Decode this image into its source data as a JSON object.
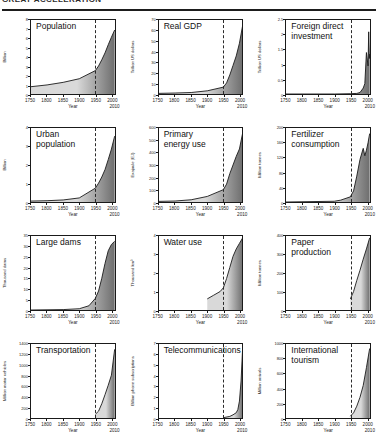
{
  "header": {
    "title": "GREAT ACCELERATION",
    "rule_color": "#1d1d1d"
  },
  "style": {
    "fill_light": "#d9d9d9",
    "fill_dark": "#6e6e6e",
    "line_color": "#1a1a1a",
    "marker_year": 1950
  },
  "axis": {
    "x_title": "Year",
    "x_ticks": [
      "1750",
      "1800",
      "1850",
      "1900",
      "1950",
      "2000"
    ],
    "x_end_label": "2010",
    "x_min": 1750,
    "x_max": 2010
  },
  "chart_data": [
    {
      "type": "area",
      "title": "Population",
      "ylabel": "Billion",
      "xlabel": "Year",
      "ylim": [
        0,
        8
      ],
      "yticks": [
        0,
        1,
        2,
        3,
        4,
        5,
        6,
        7,
        8
      ],
      "xlim": [
        1750,
        2010
      ],
      "grid": false,
      "legend": "none",
      "annotation": "dashed vertical line at 1950",
      "x": [
        1750,
        1800,
        1850,
        1900,
        1950,
        1960,
        1970,
        1980,
        1990,
        2000,
        2010
      ],
      "values": [
        0.79,
        0.98,
        1.26,
        1.65,
        2.53,
        3.03,
        3.7,
        4.44,
        5.32,
        6.14,
        6.92
      ]
    },
    {
      "type": "area",
      "title": "Real GDP",
      "ylabel": "Trillion US dollars",
      "xlabel": "Year",
      "ylim": [
        0,
        70
      ],
      "yticks": [
        0,
        10,
        20,
        30,
        40,
        50,
        60,
        70
      ],
      "xlim": [
        1750,
        2010
      ],
      "grid": false,
      "legend": "none",
      "annotation": "dashed vertical line at 1950",
      "x": [
        1750,
        1800,
        1850,
        1900,
        1950,
        1960,
        1970,
        1980,
        1990,
        2000,
        2010
      ],
      "values": [
        0.6,
        0.9,
        1.4,
        3.0,
        6.5,
        10.5,
        18.0,
        27.0,
        36.0,
        48.0,
        65.0
      ]
    },
    {
      "type": "area",
      "title": "Foreign direct\ninvestment",
      "ylabel": "Trillion US dollars",
      "xlabel": "Year",
      "ylim": [
        0,
        2.5
      ],
      "yticks": [
        0,
        0.5,
        1,
        1.5,
        2,
        2.5
      ],
      "xlim": [
        1750,
        2010
      ],
      "grid": false,
      "legend": "none",
      "annotation": "dashed vertical line at 1950",
      "x": [
        1750,
        1900,
        1950,
        1970,
        1980,
        1990,
        1995,
        2000,
        2005,
        2007,
        2009,
        2010
      ],
      "values": [
        0,
        0,
        0.01,
        0.02,
        0.05,
        0.2,
        0.35,
        1.4,
        0.95,
        2.1,
        1.2,
        1.35
      ]
    },
    {
      "type": "area",
      "title": "Urban\npopulation",
      "ylabel": "Billion",
      "xlabel": "Year",
      "ylim": [
        0,
        4
      ],
      "yticks": [
        0,
        1,
        2,
        3,
        4
      ],
      "xlim": [
        1750,
        2010
      ],
      "grid": false,
      "legend": "none",
      "annotation": "dashed vertical line at 1950",
      "x": [
        1750,
        1800,
        1850,
        1900,
        1950,
        1960,
        1970,
        1980,
        1990,
        2000,
        2010
      ],
      "values": [
        0.05,
        0.07,
        0.11,
        0.22,
        0.75,
        1.02,
        1.35,
        1.75,
        2.29,
        2.86,
        3.56
      ]
    },
    {
      "type": "area",
      "title": "Primary\nenergy use",
      "ylabel": "Exajoule (EJ)",
      "xlabel": "Year",
      "ylim": [
        0,
        600
      ],
      "yticks": [
        0,
        100,
        200,
        300,
        400,
        500,
        600
      ],
      "xlim": [
        1750,
        2010
      ],
      "grid": false,
      "legend": "none",
      "annotation": "dashed vertical line at 1950",
      "x": [
        1750,
        1800,
        1850,
        1900,
        1950,
        1960,
        1970,
        1980,
        1990,
        2000,
        2010
      ],
      "values": [
        5,
        8,
        18,
        45,
        100,
        145,
        230,
        300,
        370,
        430,
        560
      ]
    },
    {
      "type": "area",
      "title": "Fertilizer\nconsumption",
      "ylabel": "Million tonnes",
      "xlabel": "Year",
      "ylim": [
        0,
        200
      ],
      "yticks": [
        0,
        40,
        80,
        120,
        160,
        200
      ],
      "xlim": [
        1750,
        2010
      ],
      "grid": false,
      "legend": "none",
      "annotation": "dashed vertical line at 1950",
      "x": [
        1750,
        1900,
        1920,
        1950,
        1960,
        1970,
        1980,
        1990,
        1995,
        2000,
        2005,
        2010
      ],
      "values": [
        0,
        2,
        5,
        14,
        30,
        70,
        115,
        145,
        125,
        140,
        160,
        185
      ]
    },
    {
      "type": "area",
      "title": "Large dams",
      "ylabel": "Thousand dams",
      "xlabel": "Year",
      "ylim": [
        0,
        35
      ],
      "yticks": [
        0,
        5,
        10,
        15,
        20,
        25,
        30,
        35
      ],
      "xlim": [
        1750,
        2010
      ],
      "grid": false,
      "legend": "none",
      "annotation": "dashed vertical line at 1950",
      "x": [
        1750,
        1850,
        1900,
        1930,
        1950,
        1960,
        1970,
        1980,
        1990,
        2000,
        2010
      ],
      "values": [
        0,
        0.2,
        0.6,
        2.0,
        5.5,
        9.0,
        15.0,
        22.0,
        28.0,
        31.0,
        32.5
      ]
    },
    {
      "type": "area",
      "title": "Water use",
      "ylabel": "Thousand km³",
      "xlabel": "Year",
      "ylim": [
        0,
        4
      ],
      "yticks": [
        0,
        1,
        2,
        3,
        4
      ],
      "xlim": [
        1750,
        2010
      ],
      "grid": false,
      "legend": "none",
      "annotation": "dashed vertical line at 1950",
      "x": [
        1900,
        1920,
        1940,
        1950,
        1960,
        1970,
        1980,
        1990,
        2000,
        2010
      ],
      "values": [
        0.6,
        0.8,
        1.0,
        1.2,
        1.7,
        2.3,
        2.9,
        3.3,
        3.6,
        3.9
      ]
    },
    {
      "type": "area",
      "title": "Paper\nproduction",
      "ylabel": "Million tonnes",
      "xlabel": "Year",
      "ylim": [
        0,
        400
      ],
      "yticks": [
        0,
        100,
        200,
        300,
        400
      ],
      "xlim": [
        1750,
        2010
      ],
      "grid": false,
      "legend": "none",
      "annotation": "dashed vertical line at 1950",
      "x": [
        1950,
        1960,
        1970,
        1980,
        1990,
        2000,
        2010
      ],
      "values": [
        60,
        100,
        160,
        215,
        275,
        330,
        390
      ]
    },
    {
      "type": "area",
      "title": "Transportation",
      "ylabel": "Million motor vehicles",
      "xlabel": "Year",
      "ylim": [
        0,
        1400
      ],
      "yticks": [
        0,
        200,
        400,
        600,
        800,
        1000,
        1200,
        1400
      ],
      "xlim": [
        1750,
        2010
      ],
      "grid": false,
      "legend": "none",
      "annotation": "dashed vertical line at 1950",
      "x": [
        1950,
        1960,
        1970,
        1980,
        1990,
        2000,
        2010
      ],
      "values": [
        70,
        130,
        270,
        440,
        620,
        810,
        1300
      ]
    },
    {
      "type": "area",
      "title": "Telecommunications",
      "ylabel": "Billion phone subscriptions",
      "xlabel": "Year",
      "ylim": [
        0,
        7
      ],
      "yticks": [
        0,
        1,
        2,
        3,
        4,
        5,
        6,
        7
      ],
      "xlim": [
        1750,
        2010
      ],
      "grid": false,
      "legend": "none",
      "annotation": "dashed vertical line at 1950",
      "x": [
        1950,
        1970,
        1980,
        1990,
        1995,
        2000,
        2005,
        2010
      ],
      "values": [
        0.03,
        0.15,
        0.3,
        0.5,
        0.8,
        1.6,
        3.5,
        6.7
      ]
    },
    {
      "type": "area",
      "title": "International\ntourism",
      "ylabel": "Million arrivals",
      "xlabel": "Year",
      "ylim": [
        0,
        1000
      ],
      "yticks": [
        0,
        200,
        400,
        600,
        800,
        1000
      ],
      "xlim": [
        1750,
        2010
      ],
      "grid": false,
      "legend": "none",
      "annotation": "dashed vertical line at 1950",
      "x": [
        1950,
        1960,
        1970,
        1980,
        1990,
        2000,
        2010
      ],
      "values": [
        25,
        70,
        160,
        280,
        440,
        680,
        940
      ]
    }
  ]
}
